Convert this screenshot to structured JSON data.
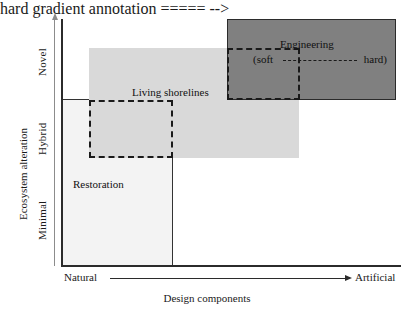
{
  "figure": {
    "type": "conceptual-quadrant-diagram",
    "axes": {
      "y": {
        "title": "Ecosystem alteration",
        "ticks": [
          "Novel",
          "Hybrid",
          "Minimal"
        ],
        "direction_indicator": "upward-arrow"
      },
      "x": {
        "title": "Design components",
        "ticks": [
          "Natural",
          "Artificial"
        ],
        "direction_indicator": "rightward-arrow"
      }
    },
    "regions": [
      {
        "id": "restoration",
        "label": "Restoration",
        "fill": "#f3f3f3",
        "border": "solid",
        "border_color": "#333333"
      },
      {
        "id": "living-shorelines",
        "label": "Living shorelines",
        "fill": "#d9d9d9",
        "border": "none",
        "border_color": ""
      },
      {
        "id": "engineering",
        "label": "Engineering",
        "fill": "#808080",
        "border": "solid",
        "border_color": "#2b2b2b"
      }
    ],
    "dashed_overlays": [
      {
        "id": "restoration-living-overlap",
        "label": "",
        "border": "dashed",
        "border_color": "#1a1a1a"
      },
      {
        "id": "soft-engineering",
        "label": "",
        "border": "dashed",
        "border_color": "#1a1a1a"
      }
    ],
    "engineering_gradient": {
      "left_label": "(soft",
      "right_label": "hard)",
      "connector": "dashed"
    }
  },
  "chart_data": {
    "type": "table",
    "title": "",
    "xlabel": "Design components",
    "ylabel": "Ecosystem alteration",
    "x_ticks": [
      "Natural",
      "Artificial"
    ],
    "y_ticks": [
      "Minimal",
      "Hybrid",
      "Novel"
    ],
    "grid": false,
    "legend": "none",
    "annotations": [
      "Restoration",
      "Living shorelines",
      "Engineering",
      "(soft",
      "hard)"
    ],
    "regions": [
      {
        "name": "Restoration",
        "x_range": [
          "Natural",
          "low-intermediate"
        ],
        "y_range": [
          "Minimal",
          "Hybrid"
        ],
        "fill": "#f3f3f3"
      },
      {
        "name": "Living shorelines",
        "x_range": [
          "low-intermediate",
          "high-intermediate"
        ],
        "y_range": [
          "Hybrid",
          "Novel"
        ],
        "fill": "#d9d9d9"
      },
      {
        "name": "Engineering",
        "x_range": [
          "high-intermediate",
          "Artificial"
        ],
        "y_range": [
          "Hybrid",
          "Novel"
        ],
        "fill": "#808080"
      }
    ]
  }
}
